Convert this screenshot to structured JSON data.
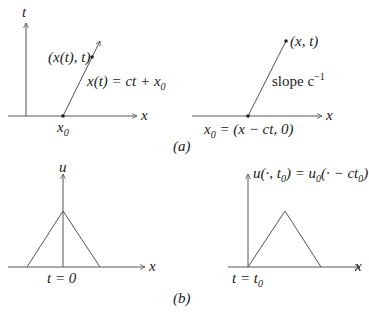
{
  "figure": {
    "panel_a": {
      "caption": "(a)",
      "left": {
        "t_axis_label": "t",
        "x_axis_label": "x",
        "point_label": "(x(t), t)",
        "line_label": "x(t) = ct + x",
        "line_label_sub": "0",
        "origin_label": "x",
        "origin_label_sub": "0"
      },
      "right": {
        "x_axis_label": "x",
        "point_label": "(x, t)",
        "slope_label": "slope c",
        "slope_sup": "−1",
        "origin_label_pre": "x",
        "origin_label_sub": "0",
        "origin_label_post": " = (x − ct, 0)"
      }
    },
    "panel_b": {
      "caption": "(b)",
      "left": {
        "u_axis_label": "u",
        "x_axis_label": "x",
        "time_label": "t = 0"
      },
      "right": {
        "u_axis_label_pre": "u(·, t",
        "u_axis_label_sub1": "0",
        "u_axis_label_mid": ") = u",
        "u_axis_label_sub2": "0",
        "u_axis_label_mid2": "(· − ct",
        "u_axis_label_sub3": "0",
        "u_axis_label_post": ")",
        "x_axis_label": "x",
        "time_label_pre": "t = t",
        "time_label_sub": "0"
      }
    },
    "colors": {
      "stroke": "#555555",
      "text": "#222222"
    }
  }
}
